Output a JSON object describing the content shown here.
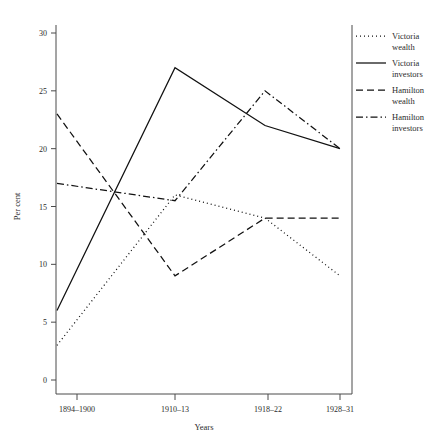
{
  "chart_data": {
    "type": "line",
    "title": "",
    "xlabel": "Years",
    "ylabel": "Per cent",
    "categories": [
      "1894–1900",
      "1910–13",
      "1918–22",
      "1928–31"
    ],
    "ylim": [
      0,
      30
    ],
    "yticks": [
      0,
      5,
      10,
      15,
      20,
      25,
      30
    ],
    "ytick_labels": [
      "0",
      "5",
      "10",
      "15",
      "20",
      "25",
      "30"
    ],
    "grid": false,
    "legend_position": "right",
    "series": [
      {
        "name": "Victoria wealth",
        "style": "dotted",
        "dash": "1,3",
        "color": "#111111",
        "values": [
          3,
          16,
          14,
          9
        ]
      },
      {
        "name": "Victoria investors",
        "style": "solid",
        "dash": "none",
        "color": "#111111",
        "values": [
          6,
          27,
          22,
          20
        ]
      },
      {
        "name": "Hamilton wealth",
        "style": "dashed",
        "dash": "7,4",
        "color": "#111111",
        "values": [
          23,
          9,
          14,
          14
        ]
      },
      {
        "name": "Hamilton investors",
        "style": "dashdot",
        "dash": "7,3,1.5,3",
        "color": "#111111",
        "values": [
          17,
          15.5,
          25,
          20
        ]
      }
    ]
  },
  "legend": {
    "entries": [
      {
        "line1": "Victoria",
        "line2": "wealth"
      },
      {
        "line1": "Victoria",
        "line2": "investors"
      },
      {
        "line1": "Hamilton",
        "line2": "wealth"
      },
      {
        "line1": "Hamilton",
        "line2": "investors"
      }
    ]
  }
}
